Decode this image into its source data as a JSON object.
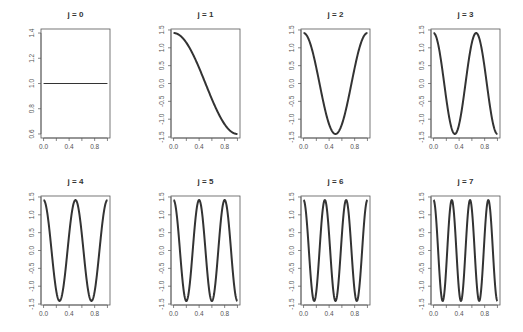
{
  "figure": {
    "layout": {
      "rows": 2,
      "cols": 4
    },
    "line_color": "#333333",
    "frame_color": "#555555",
    "text_color": "#555555"
  },
  "chart_data": [
    {
      "type": "line",
      "title": "j = 0",
      "j": 0,
      "function": "1",
      "xlim": [
        0,
        1
      ],
      "ylim": [
        0.6,
        1.4
      ],
      "xticks": [
        "0.0",
        "0.4",
        "0.8"
      ],
      "yticks": [
        "0.6",
        "0.8",
        "1.0",
        "1.2",
        "1.4"
      ],
      "x": [
        0,
        0.25,
        0.5,
        0.75,
        1
      ],
      "y": [
        1,
        1,
        1,
        1,
        1
      ],
      "xlabel": "",
      "ylabel": "",
      "grid": false
    },
    {
      "type": "line",
      "title": "j = 1",
      "j": 1,
      "function": "sqrt(2)*cos(1*pi*x)",
      "xlim": [
        0,
        1
      ],
      "ylim": [
        -1.414,
        1.414
      ],
      "xticks": [
        "0.0",
        "0.4",
        "0.8"
      ],
      "yticks": [
        "-1.5",
        "-1.0",
        "-0.5",
        "0.0",
        "0.5",
        "1.0",
        "1.5"
      ],
      "x": [
        0,
        0.25,
        0.5,
        0.75,
        1
      ],
      "y": [
        1.414,
        1.0,
        0.0,
        -1.0,
        -1.414
      ],
      "xlabel": "",
      "ylabel": "",
      "grid": false
    },
    {
      "type": "line",
      "title": "j = 2",
      "j": 2,
      "function": "sqrt(2)*cos(2*pi*x)",
      "xlim": [
        0,
        1
      ],
      "ylim": [
        -1.414,
        1.414
      ],
      "xticks": [
        "0.0",
        "0.4",
        "0.8"
      ],
      "yticks": [
        "-1.5",
        "-1.0",
        "-0.5",
        "0.0",
        "0.5",
        "1.0",
        "1.5"
      ],
      "x": [
        0,
        0.25,
        0.5,
        0.75,
        1
      ],
      "y": [
        1.414,
        0.0,
        -1.414,
        0.0,
        1.414
      ],
      "xlabel": "",
      "ylabel": "",
      "grid": false
    },
    {
      "type": "line",
      "title": "j = 3",
      "j": 3,
      "function": "sqrt(2)*cos(3*pi*x)",
      "xlim": [
        0,
        1
      ],
      "ylim": [
        -1.414,
        1.414
      ],
      "xticks": [
        "0.0",
        "0.4",
        "0.8"
      ],
      "yticks": [
        "-1.5",
        "-1.0",
        "-0.5",
        "0.0",
        "0.5",
        "1.0",
        "1.5"
      ],
      "x": [
        0,
        0.333,
        0.667,
        1
      ],
      "y": [
        1.414,
        -1.414,
        1.414,
        -1.414
      ],
      "xlabel": "",
      "ylabel": "",
      "grid": false
    },
    {
      "type": "line",
      "title": "j = 4",
      "j": 4,
      "function": "sqrt(2)*cos(4*pi*x)",
      "xlim": [
        0,
        1
      ],
      "ylim": [
        -1.414,
        1.414
      ],
      "xticks": [
        "0.0",
        "0.4",
        "0.8"
      ],
      "yticks": [
        "-1.5",
        "-1.0",
        "-0.5",
        "0.0",
        "0.5",
        "1.0",
        "1.5"
      ],
      "x": [
        0,
        0.25,
        0.5,
        0.75,
        1
      ],
      "y": [
        1.414,
        -1.414,
        1.414,
        -1.414,
        1.414
      ],
      "xlabel": "",
      "ylabel": "",
      "grid": false
    },
    {
      "type": "line",
      "title": "j = 5",
      "j": 5,
      "function": "sqrt(2)*cos(5*pi*x)",
      "xlim": [
        0,
        1
      ],
      "ylim": [
        -1.414,
        1.414
      ],
      "xticks": [
        "0.0",
        "0.4",
        "0.8"
      ],
      "yticks": [
        "-1.5",
        "-1.0",
        "-0.5",
        "0.0",
        "0.5",
        "1.0",
        "1.5"
      ],
      "x": [
        0,
        0.2,
        0.4,
        0.6,
        0.8,
        1
      ],
      "y": [
        1.414,
        -1.414,
        1.414,
        -1.414,
        1.414,
        -1.414
      ],
      "xlabel": "",
      "ylabel": "",
      "grid": false
    },
    {
      "type": "line",
      "title": "j = 6",
      "j": 6,
      "function": "sqrt(2)*cos(6*pi*x)",
      "xlim": [
        0,
        1
      ],
      "ylim": [
        -1.414,
        1.414
      ],
      "xticks": [
        "0.0",
        "0.4",
        "0.8"
      ],
      "yticks": [
        "-1.5",
        "-1.0",
        "-0.5",
        "0.0",
        "0.5",
        "1.0",
        "1.5"
      ],
      "x": [
        0,
        0.167,
        0.333,
        0.5,
        0.667,
        0.833,
        1
      ],
      "y": [
        1.414,
        -1.414,
        1.414,
        -1.414,
        1.414,
        -1.414,
        1.414
      ],
      "xlabel": "",
      "ylabel": "",
      "grid": false
    },
    {
      "type": "line",
      "title": "j = 7",
      "j": 7,
      "function": "sqrt(2)*cos(7*pi*x)",
      "xlim": [
        0,
        1
      ],
      "ylim": [
        -1.414,
        1.414
      ],
      "xticks": [
        "0.0",
        "0.4",
        "0.8"
      ],
      "yticks": [
        "-1.5",
        "-1.0",
        "-0.5",
        "0.0",
        "0.5",
        "1.0",
        "1.5"
      ],
      "x": [
        0,
        0.143,
        0.286,
        0.429,
        0.571,
        0.714,
        0.857,
        1
      ],
      "y": [
        1.414,
        -1.414,
        1.414,
        -1.414,
        1.414,
        -1.414,
        1.414,
        -1.414
      ],
      "xlabel": "",
      "ylabel": "",
      "grid": false
    }
  ]
}
